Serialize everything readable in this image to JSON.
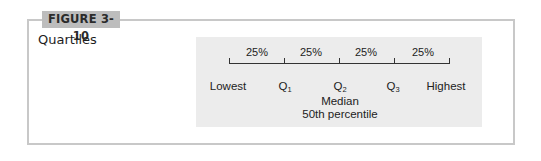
{
  "figure": {
    "label": "FIGURE 3-10",
    "title": "Quartiles"
  },
  "diagram": {
    "segments": [
      "25%",
      "25%",
      "25%",
      "25%"
    ],
    "points": [
      {
        "label": "Lowest",
        "sub": ""
      },
      {
        "label": "Q",
        "sub": "1"
      },
      {
        "label": "Q",
        "sub": "2"
      },
      {
        "label": "Q",
        "sub": "3"
      },
      {
        "label": "Highest",
        "sub": ""
      }
    ],
    "median_label": "Median",
    "median_note": "50th percentile"
  },
  "colors": {
    "label_bg": "#bdbdbd",
    "panel_bg": "#ececec",
    "frame": "#c8c8c8"
  }
}
